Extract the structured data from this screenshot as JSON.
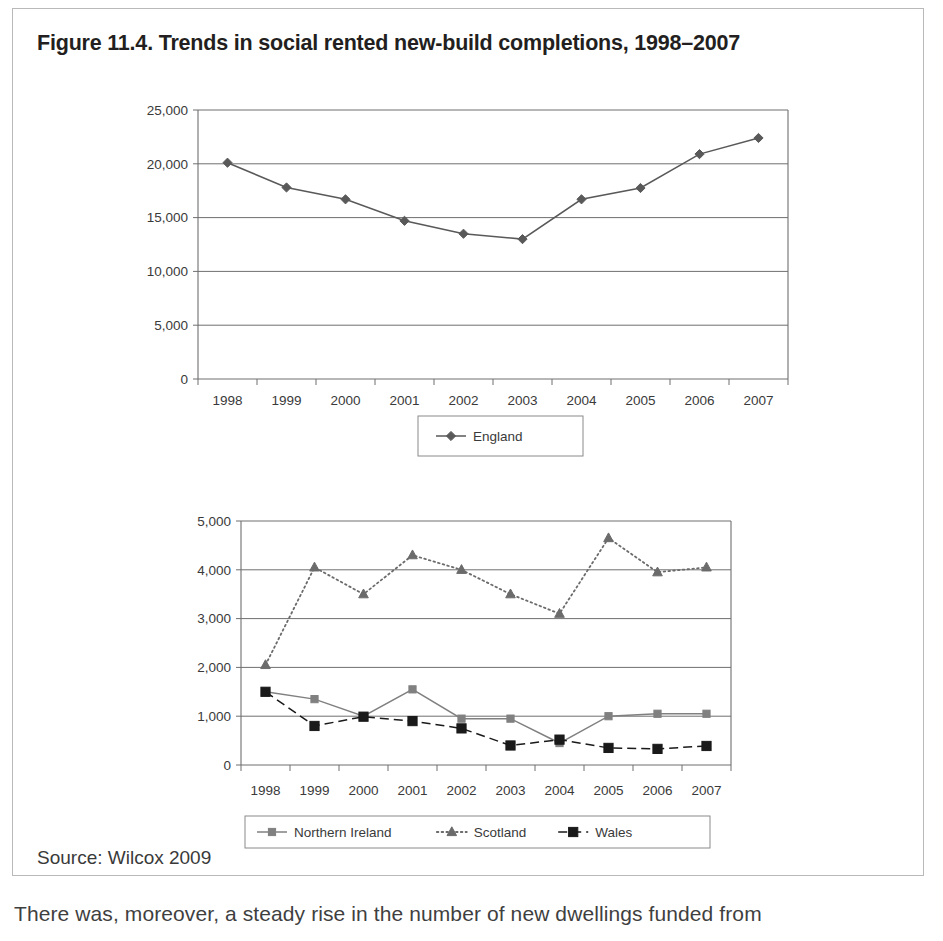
{
  "figure": {
    "title": "Figure 11.4. Trends in social rented new-build completions, 1998–2007",
    "source": "Source: Wilcox 2009",
    "body_text_fragment": "There was, moreover, a steady rise in the number of new dwellings funded from"
  },
  "chart_data": [
    {
      "type": "line",
      "id": "england-chart",
      "title": "",
      "xlabel": "",
      "ylabel": "",
      "categories": [
        "1998",
        "1999",
        "2000",
        "2001",
        "2002",
        "2003",
        "2004",
        "2005",
        "2006",
        "2007"
      ],
      "ylim": [
        0,
        25000
      ],
      "yticks": [
        0,
        5000,
        10000,
        15000,
        20000,
        25000
      ],
      "ytick_labels": [
        "0",
        "5,000",
        "10,000",
        "15,000",
        "20,000",
        "25,000"
      ],
      "grid": true,
      "legend_position": "bottom",
      "series": [
        {
          "name": "England",
          "marker": "diamond",
          "line_style": "solid",
          "color": "#595959",
          "values": [
            20100,
            17800,
            16700,
            14700,
            13500,
            13000,
            16700,
            17750,
            20900,
            22400
          ]
        }
      ]
    },
    {
      "type": "line",
      "id": "devolved-nations-chart",
      "title": "",
      "xlabel": "",
      "ylabel": "",
      "categories": [
        "1998",
        "1999",
        "2000",
        "2001",
        "2002",
        "2003",
        "2004",
        "2005",
        "2006",
        "2007"
      ],
      "ylim": [
        0,
        5000
      ],
      "yticks": [
        0,
        1000,
        2000,
        3000,
        4000,
        5000
      ],
      "ytick_labels": [
        "0",
        "1,000",
        "2,000",
        "3,000",
        "4,000",
        "5,000"
      ],
      "grid": true,
      "legend_position": "bottom",
      "series": [
        {
          "name": "Northern Ireland",
          "marker": "square",
          "line_style": "solid",
          "color": "#808080",
          "values": [
            1500,
            1350,
            1000,
            1550,
            950,
            950,
            450,
            1000,
            1050,
            1050
          ]
        },
        {
          "name": "Scotland",
          "marker": "triangle",
          "line_style": "dotted",
          "color": "#6b6b6b",
          "values": [
            2050,
            4050,
            3500,
            4300,
            4000,
            3500,
            3100,
            4650,
            3950,
            4050
          ]
        },
        {
          "name": "Wales",
          "marker": "filled-square",
          "line_style": "dashed",
          "color": "#1a1a1a",
          "values": [
            1500,
            800,
            990,
            900,
            750,
            400,
            520,
            350,
            330,
            390
          ]
        }
      ]
    }
  ]
}
